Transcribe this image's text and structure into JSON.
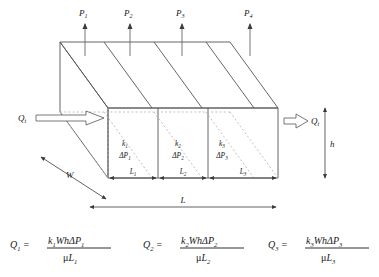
{
  "figure": {
    "colors": {
      "line": "#555555",
      "hidden": "#a8a8a8",
      "text": "#1a1a1a",
      "background": "#ffffff"
    },
    "pressure_taps": [
      {
        "name": "P1",
        "base": "P",
        "sub": "1",
        "x": 85
      },
      {
        "name": "P2",
        "base": "P",
        "sub": "2",
        "x": 130
      },
      {
        "name": "P3",
        "base": "P",
        "sub": "3",
        "x": 182
      },
      {
        "name": "P4",
        "base": "P",
        "sub": "4",
        "x": 250
      }
    ],
    "flow_in": {
      "base": "Q",
      "sub": "t",
      "label": "Qt"
    },
    "flow_out": {
      "base": "Q",
      "sub": "t",
      "label": "Qt"
    },
    "blocks": [
      {
        "perm_base": "k",
        "perm_sub": "1",
        "dp_base": "ΔP",
        "dp_sub": "1",
        "len_base": "L",
        "len_sub": "1"
      },
      {
        "perm_base": "k",
        "perm_sub": "2",
        "dp_base": "ΔP",
        "dp_sub": "2",
        "len_base": "L",
        "len_sub": "2"
      },
      {
        "perm_base": "k",
        "perm_sub": "3",
        "dp_base": "ΔP",
        "dp_sub": "3",
        "len_base": "L",
        "len_sub": "3"
      }
    ],
    "dimensions": {
      "width_label": "W",
      "height_label": "h",
      "total_length_label": "L"
    }
  },
  "equations": [
    {
      "lhs_base": "Q",
      "lhs_sub": "1",
      "num_k": "k",
      "num_k_sub": "1",
      "num_mid": "Wh",
      "num_dp": "ΔP",
      "num_dp_sub": "1",
      "den_mu": "μ",
      "den_L": "L",
      "den_L_sub": "1"
    },
    {
      "lhs_base": "Q",
      "lhs_sub": "2",
      "num_k": "k",
      "num_k_sub": "2",
      "num_mid": "Wh",
      "num_dp": "ΔP",
      "num_dp_sub": "2",
      "den_mu": "μ",
      "den_L": "L",
      "den_L_sub": "2"
    },
    {
      "lhs_base": "Q",
      "lhs_sub": "3",
      "num_k": "k",
      "num_k_sub": "3",
      "num_mid": "Wh",
      "num_dp": "ΔP",
      "num_dp_sub": "3",
      "den_mu": "μ",
      "den_L": "L",
      "den_L_sub": "3"
    }
  ]
}
